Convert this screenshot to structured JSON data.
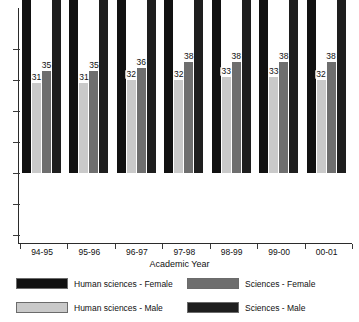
{
  "chart_data": {
    "type": "bar",
    "title": "",
    "xlabel": "Academic Year",
    "ylabel": "",
    "grid": false,
    "legend_position": "bottom",
    "ylim": [
      0,
      72
    ],
    "axis_ticks_labeled": false,
    "categories": [
      "94-95",
      "95-96",
      "96-97",
      "97-98",
      "98-99",
      "99-00",
      "00-01"
    ],
    "series": [
      {
        "name": "Human sciences - Female",
        "color": "#111111",
        "values": [
          69,
          69,
          68,
          68,
          67,
          67,
          68
        ]
      },
      {
        "name": "Human sciences - Male",
        "color": "#c9c9c9",
        "values": [
          31,
          31,
          32,
          32,
          33,
          33,
          32
        ]
      },
      {
        "name": "Sciences - Female",
        "color": "#6e6e6e",
        "values": [
          35,
          35,
          36,
          38,
          38,
          38,
          38
        ]
      },
      {
        "name": "Sciences - Male",
        "color": "#1e1e1e",
        "values": [
          65,
          65,
          64,
          62,
          62,
          62,
          62
        ]
      }
    ]
  },
  "legend": {
    "items": [
      {
        "label": "Human sciences - Female",
        "color": "#111111"
      },
      {
        "label": "Human sciences - Male",
        "color": "#c9c9c9"
      },
      {
        "label": "Sciences - Female",
        "color": "#6e6e6e"
      },
      {
        "label": "Sciences - Male",
        "color": "#1e1e1e"
      }
    ]
  }
}
